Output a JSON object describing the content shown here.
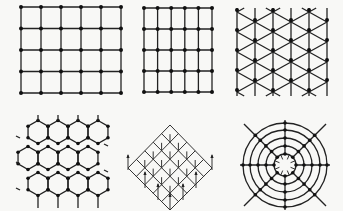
{
  "figure": {
    "panels": [
      {
        "id": "square-lattice",
        "label": "Square lattice",
        "cols": 6,
        "rows": 5,
        "x0": 21,
        "y0": 7,
        "dx": 20,
        "dy": 21.5
      },
      {
        "id": "rectangular-lattice",
        "label": "Rectangular lattice",
        "cols": 6,
        "rows": 5,
        "x0": 144,
        "y0": 8,
        "dx": 13.6,
        "dy": 21
      },
      {
        "id": "triangular-lattice",
        "label": "Triangular lattice",
        "cols": 6,
        "x0": 237,
        "dx": 18,
        "y0": 12,
        "dy": 20
      },
      {
        "id": "honeycomb-lattice",
        "label": "Honeycomb lattice"
      },
      {
        "id": "cubic-lattice-isometric",
        "label": "Cubic lattice (isometric)"
      },
      {
        "id": "polar-lattice",
        "label": "Polar lattice",
        "cx": 285,
        "cy": 165,
        "radii": [
          11,
          19,
          27,
          35,
          42
        ],
        "spokes": 8
      }
    ],
    "colors": {
      "line": "#222222",
      "node": "#111111",
      "background": "#f8f8f6"
    }
  }
}
